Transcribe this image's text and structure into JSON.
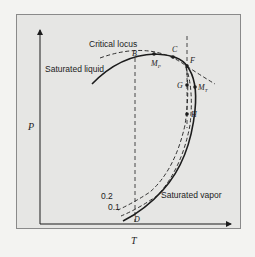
{
  "figure": {
    "axes": {
      "x_label": "T",
      "y_label": "P"
    },
    "curve_labels": {
      "critical_locus": "Critical locus",
      "saturated_liquid": "Saturated liquid",
      "saturated_vapor": "Saturated vapor"
    },
    "quality_lines": [
      {
        "label": "0.2"
      },
      {
        "label": "0.1"
      }
    ],
    "points": {
      "B": "B",
      "C": "C",
      "F": "F",
      "G": "G",
      "H": "H",
      "D": "D",
      "MP": "M",
      "MP_sub": "P",
      "MT": "M",
      "MT_sub": "T"
    },
    "colors": {
      "background": "#f3f3f1",
      "panel": "#e6e6e4",
      "ink": "#1c1c1c"
    }
  }
}
